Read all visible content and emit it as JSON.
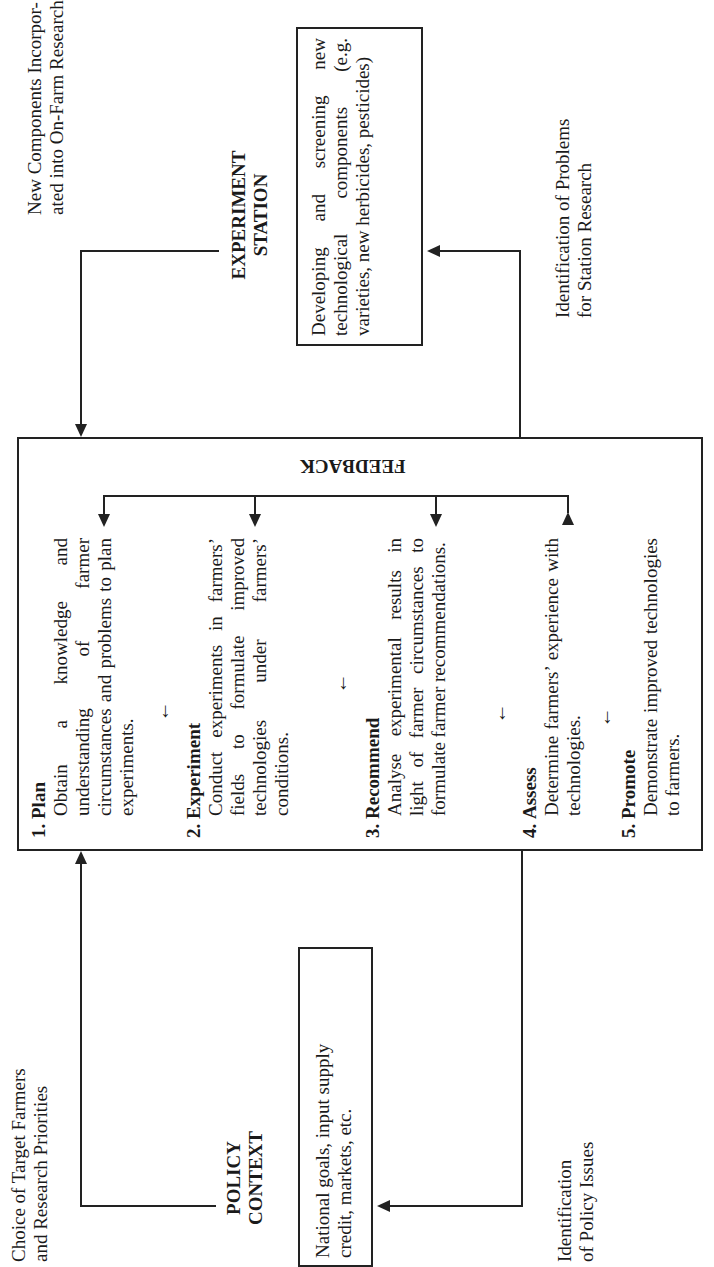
{
  "experiment_station": {
    "title_line1": "EXPERIMENT",
    "title_line2": "STATION",
    "box_lines": [
      "Developing and screening new technological com-ponents (e.g. varieties, new herbicides, pesticides)"
    ],
    "box_text": "Developing and screening new technological components (e.g. varieties, new herbicides, pesticides)"
  },
  "top_left_label": {
    "line1": "New Components Incorpor-",
    "line2": "ated into On-Farm Research"
  },
  "top_right_label": {
    "line1": "Identification of Problems",
    "line2": "for Station Research"
  },
  "policy_context": {
    "title_line1": "POLICY",
    "title_line2": "CONTEXT",
    "box_line1": "National goals, input supply",
    "box_line2": "credit, markets, etc."
  },
  "bottom_left_label": {
    "line1": "Choice of Target Farmers",
    "line2": "and Research Priorities"
  },
  "bottom_right_label": {
    "line1": "Identification",
    "line2": "of Policy Issues"
  },
  "main_box": {
    "feedback_label": "FEEDBACK",
    "steps": [
      {
        "number": "1.",
        "title": "Plan",
        "description": "Obtain a knowledge and understanding of farmer circumstances and problems to plan experiments."
      },
      {
        "number": "2.",
        "title": "Experiment",
        "description": "Conduct experiments in farmers’ fields to formulate improved technologies under farmers’ conditions."
      },
      {
        "number": "3.",
        "title": "Recommend",
        "description": "Analyse experimental results in light of farmer circumstances to formulate farmer recommendations."
      },
      {
        "number": "4.",
        "title": "Assess",
        "description": "Determine farmers’ experience with technologies."
      },
      {
        "number": "5.",
        "title": "Promote",
        "description": "Demonstrate improved technologies to farmers."
      }
    ],
    "step_arrow": "→"
  }
}
